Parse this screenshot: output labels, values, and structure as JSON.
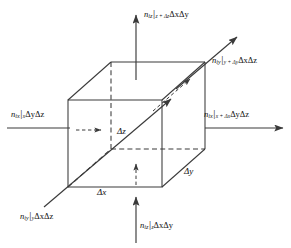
{
  "figure": {
    "type": "control-volume-mass-balance",
    "stroke_color": "#3a3a3a",
    "background": "#ffffff"
  },
  "cube": {
    "front_face": {
      "left": 68,
      "right": 162,
      "top": 100,
      "bottom": 187
    },
    "depth_offset": {
      "dx": 43,
      "dy": -38
    },
    "hidden_edges_dashed": true
  },
  "dimensions": [
    {
      "name": "delta-z",
      "label": "Δz",
      "x": 118,
      "y": 128
    },
    {
      "name": "delta-x",
      "label": "Δx",
      "x": 98,
      "y": 189
    },
    {
      "name": "delta-y",
      "label": "Δy",
      "x": 185,
      "y": 168
    }
  ],
  "fluxes": [
    {
      "name": "flux-top-out",
      "symbol": "n",
      "species": "iz",
      "bar": "|",
      "eval_at": "z + Δz",
      "area": "ΔxΔy",
      "label_x": 144,
      "label_y": 9,
      "arrow": {
        "x1": 136,
        "y1": 80,
        "x2": 136,
        "y2": 14,
        "dashed": false
      }
    },
    {
      "name": "flux-bottom-in",
      "symbol": "n",
      "species": "iz",
      "bar": "|",
      "eval_at": "z",
      "area": "ΔxΔy",
      "label_x": 140,
      "label_y": 221,
      "arrow": {
        "x1": 136,
        "y1": 243,
        "x2": 136,
        "y2": 196,
        "dashed": false
      }
    },
    {
      "name": "flux-left-in",
      "symbol": "n",
      "species": "ix",
      "bar": "|",
      "eval_at": "x",
      "area": "ΔyΔz",
      "label_x": 12,
      "label_y": 110,
      "arrow": {
        "x1": 7,
        "y1": 128,
        "x2": 72,
        "y2": 128,
        "dashed": false
      }
    },
    {
      "name": "flux-right-out",
      "symbol": "n",
      "species": "ix",
      "bar": "|",
      "eval_at": "x + Δx",
      "area": "ΔyΔz",
      "label_x": 205,
      "label_y": 110,
      "arrow": {
        "x1": 205,
        "y1": 128,
        "x2": 284,
        "y2": 128,
        "dashed": false
      }
    },
    {
      "name": "flux-back-out",
      "symbol": "n",
      "species": "iy",
      "bar": "|",
      "eval_at": "y + Δy",
      "area": "ΔxΔz",
      "label_x": 213,
      "label_y": 56,
      "arrow": {
        "x1": 175,
        "y1": 90,
        "x2": 238,
        "y2": 36,
        "dashed": false
      }
    },
    {
      "name": "flux-front-in",
      "symbol": "n",
      "species": "iy",
      "bar": "|",
      "eval_at": "y",
      "area": "ΔxΔz",
      "label_x": 22,
      "label_y": 212,
      "arrow": {
        "x1": 44,
        "y1": 206,
        "x2": 110,
        "y2": 152,
        "dashed": false
      }
    }
  ],
  "interior_arrows": [
    {
      "name": "interior-arrow-left",
      "dashed": true
    },
    {
      "name": "interior-arrow-bottom",
      "dashed": true
    },
    {
      "name": "interior-arrow-back",
      "dashed": true
    }
  ]
}
